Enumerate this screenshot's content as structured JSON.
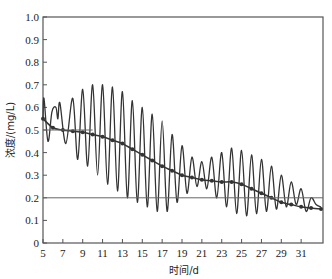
{
  "chart_data": {
    "type": "line",
    "title": "",
    "xlabel": "时间/d",
    "ylabel": "浓度/(mg/L)",
    "xlim": [
      5,
      33.2
    ],
    "ylim": [
      0,
      1.0
    ],
    "grid": false,
    "legend": null,
    "x_ticks": [
      5,
      7,
      9,
      11,
      13,
      15,
      17,
      19,
      21,
      23,
      25,
      27,
      29,
      31
    ],
    "y_ticks": [
      0,
      0.1,
      0.2,
      0.3,
      0.4,
      0.5,
      0.6,
      0.7,
      0.8,
      0.9,
      1.0
    ],
    "y_tick_labels": [
      "0",
      "0.1",
      "0.2",
      "0.3",
      "0.4",
      "0.5",
      "0.6",
      "0.7",
      "0.8",
      "0.9",
      "1.0"
    ],
    "series": [
      {
        "name": "measured-oscillating",
        "style": "line",
        "x": [
          5.0,
          5.1,
          5.5,
          5.9,
          6.3,
          6.5,
          6.7,
          7.3,
          8.0,
          8.5,
          9.0,
          9.5,
          10.0,
          10.5,
          11.0,
          11.5,
          12.0,
          12.5,
          13.0,
          13.5,
          14.0,
          14.5,
          15.0,
          15.5,
          16.0,
          16.5,
          17.0,
          17.5,
          18.0,
          18.5,
          19.0,
          19.5,
          20.0,
          20.5,
          21.0,
          21.5,
          22.0,
          22.5,
          23.0,
          23.5,
          24.0,
          24.5,
          25.0,
          25.5,
          26.0,
          26.5,
          27.0,
          27.5,
          28.0,
          28.5,
          29.0,
          29.5,
          30.0,
          30.5,
          31.0,
          31.5,
          32.0,
          32.5,
          33.0
        ],
        "y": [
          0.55,
          0.64,
          0.45,
          0.58,
          0.6,
          0.55,
          0.62,
          0.44,
          0.64,
          0.37,
          0.68,
          0.34,
          0.7,
          0.3,
          0.7,
          0.26,
          0.69,
          0.23,
          0.67,
          0.2,
          0.63,
          0.18,
          0.6,
          0.16,
          0.57,
          0.14,
          0.54,
          0.14,
          0.48,
          0.18,
          0.43,
          0.22,
          0.38,
          0.25,
          0.36,
          0.24,
          0.38,
          0.2,
          0.4,
          0.16,
          0.42,
          0.13,
          0.41,
          0.12,
          0.39,
          0.13,
          0.37,
          0.14,
          0.34,
          0.15,
          0.3,
          0.16,
          0.27,
          0.17,
          0.24,
          0.14,
          0.2,
          0.17,
          0.16
        ]
      },
      {
        "name": "trend-with-markers",
        "style": "line+markers",
        "x": [
          5,
          6,
          7,
          8,
          9,
          10,
          11,
          12,
          13,
          14,
          15,
          16,
          17,
          18,
          19,
          20,
          21,
          22,
          23,
          24,
          25,
          26,
          27,
          28,
          29,
          30,
          31,
          32,
          33
        ],
        "y": [
          0.55,
          0.51,
          0.5,
          0.495,
          0.49,
          0.48,
          0.47,
          0.455,
          0.44,
          0.415,
          0.39,
          0.365,
          0.34,
          0.32,
          0.3,
          0.29,
          0.28,
          0.275,
          0.27,
          0.27,
          0.26,
          0.24,
          0.22,
          0.2,
          0.18,
          0.17,
          0.16,
          0.155,
          0.15
        ]
      },
      {
        "name": "reference-0.5",
        "style": "hline",
        "x": [
          5,
          10
        ],
        "y": [
          0.5,
          0.5
        ]
      },
      {
        "name": "reference-0.2",
        "style": "hline",
        "x": [
          5,
          33.2
        ],
        "y": [
          0.2,
          0.2
        ]
      }
    ]
  },
  "colors": {
    "line": "#333333",
    "axis": "#555555",
    "reference": "#666666"
  }
}
